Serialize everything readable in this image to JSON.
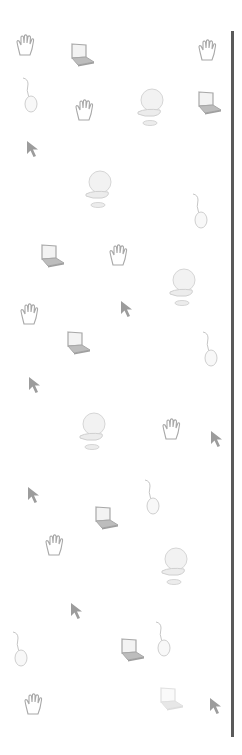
{
  "pattern": {
    "background": "#ffffff",
    "icon_color": "#a8a8a8",
    "line_color": "#5a5a5a",
    "icons": [
      {
        "type": "hand-icon",
        "x": 14,
        "y": 33
      },
      {
        "type": "laptop-icon",
        "x": 66,
        "y": 42
      },
      {
        "type": "hand-icon",
        "x": 196,
        "y": 38
      },
      {
        "type": "mouse-icon",
        "x": 20,
        "y": 76
      },
      {
        "type": "hand-icon",
        "x": 73,
        "y": 98
      },
      {
        "type": "computer-icon",
        "x": 134,
        "y": 86
      },
      {
        "type": "laptop-icon",
        "x": 193,
        "y": 90
      },
      {
        "type": "arrow-icon",
        "x": 26,
        "y": 140
      },
      {
        "type": "computer-icon",
        "x": 82,
        "y": 168
      },
      {
        "type": "mouse-icon",
        "x": 190,
        "y": 192
      },
      {
        "type": "laptop-icon",
        "x": 36,
        "y": 243
      },
      {
        "type": "hand-icon",
        "x": 107,
        "y": 243
      },
      {
        "type": "computer-icon",
        "x": 166,
        "y": 266
      },
      {
        "type": "hand-icon",
        "x": 18,
        "y": 302
      },
      {
        "type": "arrow-icon",
        "x": 120,
        "y": 300
      },
      {
        "type": "laptop-icon",
        "x": 62,
        "y": 330
      },
      {
        "type": "mouse-icon",
        "x": 200,
        "y": 330
      },
      {
        "type": "arrow-icon",
        "x": 28,
        "y": 376
      },
      {
        "type": "computer-icon",
        "x": 76,
        "y": 410
      },
      {
        "type": "hand-icon",
        "x": 160,
        "y": 417
      },
      {
        "type": "arrow-icon",
        "x": 210,
        "y": 430
      },
      {
        "type": "mouse-icon",
        "x": 142,
        "y": 478
      },
      {
        "type": "arrow-icon",
        "x": 27,
        "y": 486
      },
      {
        "type": "laptop-icon",
        "x": 90,
        "y": 505
      },
      {
        "type": "hand-icon",
        "x": 43,
        "y": 533
      },
      {
        "type": "computer-icon",
        "x": 158,
        "y": 545
      },
      {
        "type": "arrow-icon",
        "x": 70,
        "y": 602
      },
      {
        "type": "mouse-icon",
        "x": 153,
        "y": 620
      },
      {
        "type": "laptop-icon",
        "x": 116,
        "y": 637
      },
      {
        "type": "mouse-icon",
        "x": 10,
        "y": 630
      },
      {
        "type": "hand-icon",
        "x": 22,
        "y": 692
      },
      {
        "type": "laptop-icon",
        "x": 155,
        "y": 686,
        "faint": true
      },
      {
        "type": "arrow-icon",
        "x": 209,
        "y": 697
      }
    ]
  }
}
